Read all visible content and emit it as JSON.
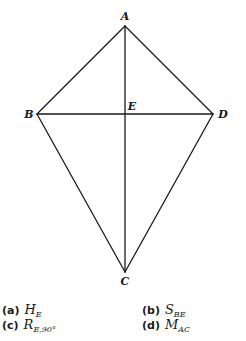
{
  "diagram": {
    "type": "kite",
    "stroke_color": "#1a1a1a",
    "vertices": {
      "A": {
        "label": "A",
        "x": 125,
        "y": 26,
        "label_x": 125,
        "label_y": 20
      },
      "B": {
        "label": "B",
        "x": 37,
        "y": 114,
        "label_x": 29,
        "label_y": 118
      },
      "D": {
        "label": "D",
        "x": 213,
        "y": 114,
        "label_x": 223,
        "label_y": 118
      },
      "C": {
        "label": "C",
        "x": 125,
        "y": 272,
        "label_x": 125,
        "label_y": 285
      },
      "E": {
        "label": "E",
        "x": 125,
        "y": 114,
        "label_x": 132,
        "label_y": 110
      }
    },
    "edges": [
      [
        "A",
        "B"
      ],
      [
        "A",
        "D"
      ],
      [
        "B",
        "C"
      ],
      [
        "D",
        "C"
      ],
      [
        "A",
        "C"
      ],
      [
        "B",
        "D"
      ]
    ]
  },
  "options": [
    {
      "letter": "(a)",
      "symbol": "H",
      "subscript": "E"
    },
    {
      "letter": "(b)",
      "symbol": "S",
      "subscript": "BE"
    },
    {
      "letter": "(c)",
      "symbol": "R",
      "subscript": "E,90°"
    },
    {
      "letter": "(d)",
      "symbol": "M",
      "subscript": "AC"
    }
  ]
}
